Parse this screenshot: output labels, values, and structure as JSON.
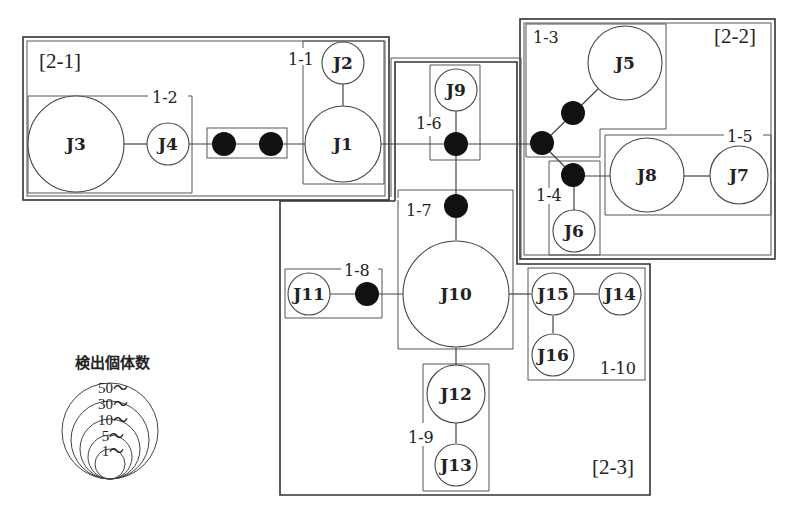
{
  "regions": [
    {
      "id": "2-1",
      "label": "[2-1]"
    },
    {
      "id": "2-2",
      "label": "[2-2]"
    },
    {
      "id": "2-3",
      "label": "[2-3]"
    }
  ],
  "groups": [
    {
      "id": "1-1",
      "label": "1-1",
      "nodes": [
        "J1",
        "J2"
      ]
    },
    {
      "id": "1-2",
      "label": "1-2",
      "nodes": [
        "J3",
        "J4"
      ]
    },
    {
      "id": "1-3",
      "label": "1-3",
      "nodes": [
        "J5"
      ]
    },
    {
      "id": "1-4",
      "label": "1-4",
      "nodes": [
        "J6"
      ]
    },
    {
      "id": "1-5",
      "label": "1-5",
      "nodes": [
        "J7",
        "J8"
      ]
    },
    {
      "id": "1-6",
      "label": "1-6",
      "nodes": [
        "J9"
      ]
    },
    {
      "id": "1-7",
      "label": "1-7",
      "nodes": [
        "J10"
      ]
    },
    {
      "id": "1-8",
      "label": "1-8",
      "nodes": [
        "J11"
      ]
    },
    {
      "id": "1-9",
      "label": "1-9",
      "nodes": [
        "J12",
        "J13"
      ]
    },
    {
      "id": "1-10",
      "label": "1-10",
      "nodes": [
        "J14",
        "J15",
        "J16"
      ]
    }
  ],
  "nodes": {
    "J1": "J1",
    "J2": "J2",
    "J3": "J3",
    "J4": "J4",
    "J5": "J5",
    "J6": "J6",
    "J7": "J7",
    "J8": "J8",
    "J9": "J9",
    "J10": "J10",
    "J11": "J11",
    "J12": "J12",
    "J13": "J13",
    "J14": "J14",
    "J15": "J15",
    "J16": "J16"
  },
  "legend": {
    "title": "検出個体数",
    "ticks": [
      "50〜",
      "30〜",
      "10〜",
      "5〜",
      "1〜"
    ]
  },
  "colors": {
    "line": "#444444",
    "junction_dot": "#111111",
    "background": "#ffffff"
  }
}
